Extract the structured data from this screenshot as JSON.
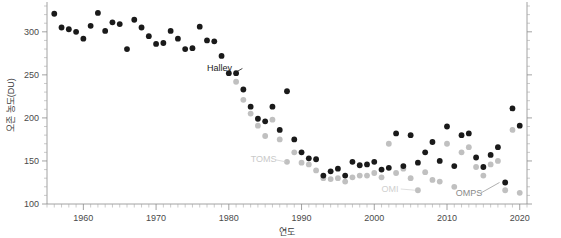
{
  "chart_data": {
    "type": "scatter",
    "title": "",
    "xlabel": "연도",
    "ylabel": "오존 농도(DU)",
    "xlim": [
      1955,
      2021
    ],
    "ylim": [
      100,
      330
    ],
    "grid": false,
    "legend_position": "inline-annotations",
    "x_ticks": [
      1960,
      1970,
      1980,
      1990,
      2000,
      2010,
      2020
    ],
    "x_tick_labels": [
      "1960",
      "1970",
      "1980",
      "1990",
      "2000",
      "2010",
      "2020"
    ],
    "x_minor_tick_step": 1,
    "y_ticks": [
      100,
      150,
      200,
      250,
      300
    ],
    "y_tick_labels": [
      "100",
      "150",
      "200",
      "250",
      "300"
    ],
    "y_minor_tick_step": 10,
    "annotations": [
      {
        "name": "Halley",
        "label": "Halley",
        "color": "#1a1a1a",
        "text_x": 1977.0,
        "text_y": 258,
        "point_x": 1981.3,
        "point_y": 252
      },
      {
        "name": "TOMS",
        "label": "TOMS",
        "color": "#c9c9c9",
        "text_x": 1983.0,
        "text_y": 152,
        "point_x": 1988.4,
        "point_y": 149
      },
      {
        "name": "OMI",
        "label": "OMI",
        "color": "#cfcfcf",
        "text_x": 2001.0,
        "text_y": 118,
        "point_x": 2006.2,
        "point_y": 116
      },
      {
        "name": "OMPS",
        "label": "OMPS",
        "color": "#8a8a8a",
        "text_x": 2011.2,
        "text_y": 113,
        "point_x": 2017.8,
        "point_y": 125
      }
    ],
    "series": [
      {
        "name": "Halley",
        "marker": "circle",
        "color": "#1a1a1a",
        "points": [
          [
            1956,
            321
          ],
          [
            1957,
            305
          ],
          [
            1958,
            303
          ],
          [
            1959,
            300
          ],
          [
            1960,
            292
          ],
          [
            1961,
            307
          ],
          [
            1962,
            322
          ],
          [
            1963,
            301
          ],
          [
            1964,
            311
          ],
          [
            1965,
            309
          ],
          [
            1966,
            280
          ],
          [
            1967,
            314
          ],
          [
            1968,
            305
          ],
          [
            1969,
            295
          ],
          [
            1970,
            286
          ],
          [
            1971,
            287
          ],
          [
            1972,
            301
          ],
          [
            1973,
            292
          ],
          [
            1974,
            280
          ],
          [
            1975,
            281
          ],
          [
            1976,
            306
          ],
          [
            1977,
            290
          ],
          [
            1978,
            289
          ],
          [
            1979,
            272
          ],
          [
            1980,
            252
          ],
          [
            1981,
            252
          ],
          [
            1982,
            233
          ],
          [
            1983,
            213
          ],
          [
            1984,
            199
          ],
          [
            1985,
            196
          ],
          [
            1986,
            213
          ],
          [
            1987,
            186
          ],
          [
            1988,
            231
          ],
          [
            1989,
            175
          ],
          [
            1990,
            160
          ],
          [
            1991,
            153
          ],
          [
            1992,
            152
          ],
          [
            1993,
            133
          ],
          [
            1994,
            138
          ],
          [
            1995,
            141
          ],
          [
            1996,
            133
          ],
          [
            1997,
            149
          ],
          [
            1998,
            145
          ],
          [
            1999,
            146
          ],
          [
            2000,
            149
          ],
          [
            2001,
            140
          ],
          [
            2002,
            142
          ],
          [
            2003,
            182
          ],
          [
            2004,
            144
          ],
          [
            2005,
            180
          ],
          [
            2006,
            148
          ],
          [
            2007,
            160
          ],
          [
            2008,
            172
          ],
          [
            2009,
            150
          ],
          [
            2010,
            190
          ],
          [
            2011,
            144
          ],
          [
            2012,
            180
          ],
          [
            2013,
            182
          ],
          [
            2014,
            154
          ],
          [
            2015,
            143
          ],
          [
            2016,
            157
          ],
          [
            2017,
            166
          ],
          [
            2018,
            125
          ],
          [
            2019,
            211
          ],
          [
            2020,
            191
          ]
        ]
      },
      {
        "name": "Satellite (TOMS/OMI/OMPS)",
        "marker": "circle",
        "color": "#c0c0c0",
        "points": [
          [
            1981,
            242
          ],
          [
            1982,
            221
          ],
          [
            1983,
            205
          ],
          [
            1984,
            191
          ],
          [
            1985,
            179
          ],
          [
            1986,
            198
          ],
          [
            1987,
            175
          ],
          [
            1988,
            149
          ],
          [
            1989,
            160
          ],
          [
            1990,
            148
          ],
          [
            1991,
            146
          ],
          [
            1992,
            139
          ],
          [
            1993,
            130
          ],
          [
            1994,
            129
          ],
          [
            1995,
            130
          ],
          [
            1996,
            126
          ],
          [
            1997,
            131
          ],
          [
            1998,
            133
          ],
          [
            1999,
            133
          ],
          [
            2000,
            136
          ],
          [
            2001,
            131
          ],
          [
            2002,
            170
          ],
          [
            2003,
            136
          ],
          [
            2004,
            141
          ],
          [
            2005,
            130
          ],
          [
            2006,
            116
          ],
          [
            2007,
            137
          ],
          [
            2008,
            128
          ],
          [
            2009,
            126
          ],
          [
            2010,
            170
          ],
          [
            2011,
            120
          ],
          [
            2012,
            160
          ],
          [
            2013,
            166
          ],
          [
            2014,
            143
          ],
          [
            2015,
            133
          ],
          [
            2016,
            146
          ],
          [
            2017,
            150
          ],
          [
            2018,
            116
          ],
          [
            2019,
            186
          ],
          [
            2020,
            113
          ]
        ]
      }
    ]
  }
}
